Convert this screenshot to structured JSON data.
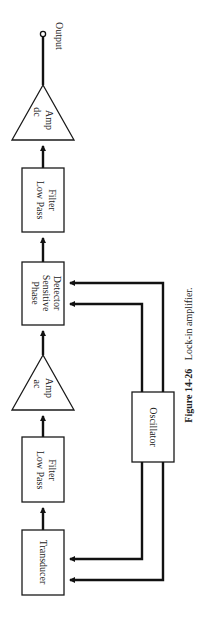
{
  "diagram": {
    "blocks": [
      {
        "id": "transducer",
        "label": "Transducer",
        "shape": "rectangle"
      },
      {
        "id": "lpf1",
        "label_line1": "Low Pass",
        "label_line2": "Filter",
        "shape": "rectangle"
      },
      {
        "id": "ac_amp",
        "label_line1": "ac",
        "label_line2": "Amp",
        "shape": "triangle"
      },
      {
        "id": "psd",
        "label_line1": "Phase",
        "label_line2": "Sensitive",
        "label_line3": "Detector",
        "shape": "rectangle"
      },
      {
        "id": "lpf2",
        "label_line1": "Low Pass",
        "label_line2": "Filter",
        "shape": "rectangle"
      },
      {
        "id": "dc_amp",
        "label_line1": "dc",
        "label_line2": "Amp",
        "shape": "triangle"
      },
      {
        "id": "oscillator",
        "label": "Oscillator",
        "shape": "rectangle"
      }
    ],
    "output_label": "Output",
    "connections": [
      {
        "from": "transducer",
        "to": "lpf1"
      },
      {
        "from": "lpf1",
        "to": "ac_amp"
      },
      {
        "from": "ac_amp",
        "to": "psd"
      },
      {
        "from": "psd",
        "to": "lpf2"
      },
      {
        "from": "lpf2",
        "to": "dc_amp"
      },
      {
        "from": "dc_amp",
        "to": "output"
      },
      {
        "from": "oscillator",
        "to": "psd",
        "count": 2
      },
      {
        "from": "oscillator",
        "to": "transducer",
        "count": 2
      }
    ]
  },
  "caption": {
    "figure_number": "Figure 14-26",
    "text": "Lock-in amplifier."
  },
  "colors": {
    "line": "#111111",
    "background": "#ffffff"
  }
}
